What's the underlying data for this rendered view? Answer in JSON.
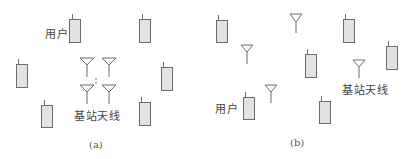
{
  "figure": {
    "top_cutoff_text": "",
    "colors": {
      "stroke": "#6b6b6b",
      "phone_fill": "#e2e2e2",
      "text": "#444444"
    },
    "panels": [
      {
        "id": "a",
        "caption": "(a)",
        "caption_pos": [
          89,
          139
        ],
        "user_label": {
          "text": "用户",
          "pos": [
            45,
            29
          ]
        },
        "antenna_label": {
          "text": "基站天线",
          "pos": [
            74,
            111
          ]
        },
        "users": [
          {
            "x": 69,
            "y": 19,
            "w": 11,
            "h": 23,
            "stub_x": 72
          },
          {
            "x": 139,
            "y": 19,
            "w": 11,
            "h": 23,
            "stub_x": 142
          },
          {
            "x": 16,
            "y": 64,
            "w": 11,
            "h": 23,
            "stub_x": 18
          },
          {
            "x": 161,
            "y": 67,
            "w": 11,
            "h": 23,
            "stub_x": 163
          },
          {
            "x": 41,
            "y": 105,
            "w": 11,
            "h": 22,
            "stub_x": 44
          },
          {
            "x": 139,
            "y": 102,
            "w": 11,
            "h": 23,
            "stub_x": 141
          }
        ],
        "antennas": [
          {
            "cx": 87,
            "top": 58,
            "tri_h": 7,
            "half_w": 7,
            "mast_bottom": 77
          },
          {
            "cx": 109,
            "top": 58,
            "tri_h": 7,
            "half_w": 7,
            "mast_bottom": 77
          },
          {
            "cx": 87,
            "top": 85,
            "tri_h": 7,
            "half_w": 7,
            "mast_bottom": 104
          },
          {
            "cx": 109,
            "top": 85,
            "tri_h": 7,
            "half_w": 7,
            "mast_bottom": 104
          }
        ],
        "ellipsis_dots": [
          [
            96,
            79
          ],
          [
            96,
            83
          ]
        ]
      },
      {
        "id": "b",
        "caption": "(b)",
        "caption_pos": [
          290,
          137
        ],
        "user_label": {
          "text": "用户",
          "pos": [
            215,
            104
          ]
        },
        "antenna_label": {
          "text": "基站天线",
          "pos": [
            342,
            85
          ]
        },
        "users": [
          {
            "x": 216,
            "y": 20,
            "w": 11,
            "h": 22,
            "stub_x": 218
          },
          {
            "x": 343,
            "y": 19,
            "w": 11,
            "h": 23,
            "stub_x": 345
          },
          {
            "x": 305,
            "y": 54,
            "w": 11,
            "h": 23,
            "stub_x": 307
          },
          {
            "x": 386,
            "y": 46,
            "w": 11,
            "h": 23,
            "stub_x": 388
          },
          {
            "x": 243,
            "y": 97,
            "w": 11,
            "h": 22,
            "stub_x": 245
          },
          {
            "x": 319,
            "y": 101,
            "w": 11,
            "h": 22,
            "stub_x": 321
          }
        ],
        "antennas": [
          {
            "cx": 296,
            "top": 14,
            "tri_h": 8,
            "half_w": 6,
            "mast_bottom": 33
          },
          {
            "cx": 247,
            "top": 45,
            "tri_h": 7,
            "half_w": 6,
            "mast_bottom": 64
          },
          {
            "cx": 359,
            "top": 60,
            "tri_h": 7,
            "half_w": 6,
            "mast_bottom": 78
          },
          {
            "cx": 271,
            "top": 85,
            "tri_h": 7,
            "half_w": 6,
            "mast_bottom": 103
          }
        ],
        "ellipsis_dots": []
      }
    ]
  }
}
